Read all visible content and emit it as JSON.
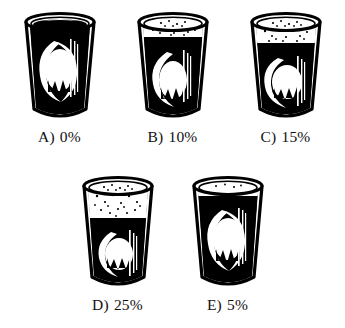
{
  "figure": {
    "name": "beer-glass-foam-percentage-multiple-choice",
    "background_color": "#ffffff",
    "ink_color": "#000000",
    "liquid_color": "#000000",
    "foam_color": "#ffffff"
  },
  "rows": [
    {
      "name": "top-row",
      "options": [
        {
          "id": "A",
          "label": "A)",
          "value": "0%",
          "caption": "A) 0%",
          "foam_percent": 0,
          "liquid_percent": 100,
          "glass_name": "beer-glass-a"
        },
        {
          "id": "B",
          "label": "B)",
          "value": "10%",
          "caption": "B) 10%",
          "foam_percent": 10,
          "liquid_percent": 90,
          "glass_name": "beer-glass-b"
        },
        {
          "id": "C",
          "label": "C)",
          "value": "15%",
          "caption": "C) 15%",
          "foam_percent": 15,
          "liquid_percent": 85,
          "glass_name": "beer-glass-c"
        }
      ]
    },
    {
      "name": "bottom-row",
      "options": [
        {
          "id": "D",
          "label": "D)",
          "value": "25%",
          "caption": "D) 25%",
          "foam_percent": 25,
          "liquid_percent": 75,
          "glass_name": "beer-glass-d"
        },
        {
          "id": "E",
          "label": "E)",
          "value": "5%",
          "caption": "E) 5%",
          "foam_percent": 5,
          "liquid_percent": 95,
          "glass_name": "beer-glass-e"
        }
      ]
    }
  ]
}
